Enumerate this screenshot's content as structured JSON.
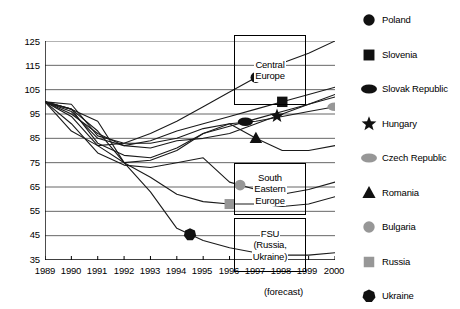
{
  "chart_data": {
    "type": "line",
    "title": "",
    "xlabel": "",
    "ylabel": "",
    "x": [
      1989,
      1990,
      1991,
      1992,
      1993,
      1994,
      1995,
      1996,
      1997,
      1998,
      1999,
      2000
    ],
    "xlim": [
      1989,
      2000
    ],
    "ylim": [
      35,
      125
    ],
    "yticks": [
      35,
      45,
      55,
      65,
      75,
      85,
      95,
      105,
      115,
      125
    ],
    "xticks": [
      "1989",
      "1990",
      "1991",
      "1992",
      "1993",
      "1994",
      "1995",
      "1996",
      "1997",
      "1998",
      "1999",
      "2000"
    ],
    "grid": true,
    "legend_position": "right",
    "note": "(forecast)",
    "series": [
      {
        "name": "Poland",
        "marker": "circle",
        "color": "#111111",
        "values": [
          100,
          88,
          82,
          83,
          87,
          92,
          98,
          104,
          110,
          116,
          120,
          125
        ]
      },
      {
        "name": "Slovenia",
        "marker": "square",
        "color": "#111111",
        "values": [
          100,
          95,
          87,
          82,
          84,
          88,
          91,
          94,
          97,
          100,
          103,
          106
        ]
      },
      {
        "name": "Slovak Republic",
        "marker": "oval",
        "color": "#111111",
        "values": [
          100,
          97,
          83,
          78,
          77,
          81,
          87,
          90,
          93,
          96,
          99,
          102
        ]
      },
      {
        "name": "Hungary",
        "marker": "star",
        "color": "#111111",
        "values": [
          100,
          96,
          85,
          82,
          81,
          84,
          85,
          87,
          91,
          95,
          99,
          103
        ]
      },
      {
        "name": "Czech Republic",
        "marker": "oval-gray",
        "color": "#9a9a9a",
        "values": [
          100,
          99,
          86,
          83,
          83,
          85,
          89,
          91,
          92,
          94,
          96,
          98
        ]
      },
      {
        "name": "Romania",
        "marker": "triangle",
        "color": "#111111",
        "values": [
          100,
          94,
          82,
          75,
          76,
          80,
          87,
          91,
          85,
          80,
          80,
          82
        ]
      },
      {
        "name": "Bulgaria",
        "marker": "circle-gray",
        "color": "#8e8e8e",
        "values": [
          100,
          91,
          79,
          74,
          73,
          75,
          77,
          67,
          64,
          62,
          64,
          67
        ]
      },
      {
        "name": "Russia",
        "marker": "square-gray",
        "color": "#9a9a9a",
        "values": [
          100,
          97,
          92,
          75,
          69,
          62,
          59,
          58,
          58,
          57,
          58,
          61
        ]
      },
      {
        "name": "Ukraine",
        "marker": "heptagon",
        "color": "#111111",
        "values": [
          100,
          97,
          88,
          75,
          63,
          48,
          43,
          40,
          38,
          37,
          37,
          38
        ]
      }
    ],
    "annotations": [
      {
        "id": "central-europe",
        "lines": [
          "Central",
          "Europe"
        ]
      },
      {
        "id": "south-eastern-europe",
        "lines": [
          "South",
          "Eastern",
          "Europe"
        ]
      },
      {
        "id": "fsu",
        "lines": [
          "FSU",
          "(Russia,",
          "Ukraine)"
        ]
      }
    ]
  },
  "legend": {
    "items": [
      {
        "label": "Poland",
        "marker": "circle"
      },
      {
        "label": "Slovenia",
        "marker": "square"
      },
      {
        "label": "Slovak Republic",
        "marker": "oval"
      },
      {
        "label": "Hungary",
        "marker": "star"
      },
      {
        "label": "Czech Republic",
        "marker": "oval-gray"
      },
      {
        "label": "Romania",
        "marker": "triangle"
      },
      {
        "label": "Bulgaria",
        "marker": "circle-gray"
      },
      {
        "label": "Russia",
        "marker": "square-gray"
      },
      {
        "label": "Ukraine",
        "marker": "heptagon"
      }
    ]
  },
  "axis": {
    "y_labels": [
      "125",
      "115",
      "105",
      "95",
      "85",
      "75",
      "65",
      "55",
      "45",
      "35"
    ],
    "x_labels": [
      "1989",
      "1990",
      "1991",
      "1992",
      "1993",
      "1994",
      "1995",
      "1996",
      "1997",
      "1998",
      "1999",
      "2000"
    ],
    "forecast_note": "(forecast)"
  },
  "annotation_boxes": {
    "central_europe": {
      "line1": "Central",
      "line2": "Europe"
    },
    "south_eastern_europe": {
      "line1": "South",
      "line2": "Eastern",
      "line3": "Europe"
    },
    "fsu": {
      "line1": "FSU",
      "line2": "(Russia,",
      "line3": "Ukraine)"
    }
  },
  "colors": {
    "line": "#1a1a1a",
    "gray_marker": "#979797",
    "grid": "#555555",
    "axis": "#000000"
  }
}
